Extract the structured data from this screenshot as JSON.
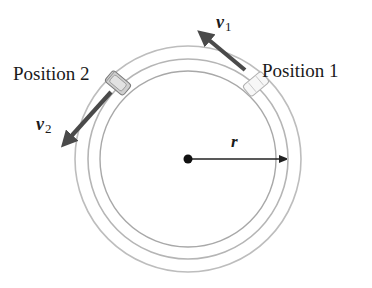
{
  "diagram": {
    "labels": {
      "position1": "Position 1",
      "position2": "Position 2",
      "v1_symbol": "v",
      "v1_subscript": "1",
      "v2_symbol": "v",
      "v2_subscript": "2",
      "radius": "r"
    },
    "colors": {
      "ring": "#b8b8b8",
      "inner_ring": "#a8a8a8",
      "velocity_arrow": "#4a4a4a",
      "radius_arrow": "#222222",
      "center_dot": "#111111",
      "car2_body": "#c9c9c9",
      "car1_body": "#f4f4f4",
      "text": "#1a1a1a"
    }
  }
}
